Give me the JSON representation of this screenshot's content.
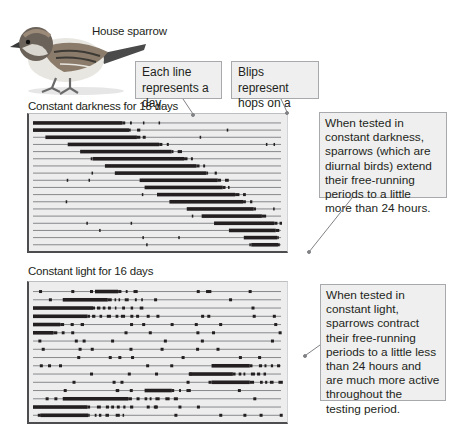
{
  "figure": {
    "species_label": "House sparrow",
    "callouts": {
      "each_line": "Each line represents a day.",
      "each_line_lines": [
        "Each line",
        "represents a day."
      ],
      "blips": "Blips represent hops on a perch.",
      "blips_lines": [
        "Blips represent",
        "hops on a perch."
      ],
      "darkness_note": "When tested in constant darkness, sparrows (which are diurnal birds) extend their free-running periods to a little more than 24 hours.",
      "light_note": "When tested in constant light, sparrows contract their free-running periods to a little less than 24 hours and are much more active throughout the testing period."
    },
    "panels": [
      {
        "title": "Constant darkness for 18 days",
        "condition": "constant darkness",
        "days": 18,
        "trend": "activity onset drifts later each day (period > 24 h)"
      },
      {
        "title": "Constant light for 16 days",
        "condition": "constant light",
        "days": 16,
        "trend": "activity onset drifts earlier each day (period < 24 h)"
      }
    ],
    "colors": {
      "panel_bg": "#ededee",
      "callout_bg": "#efefef",
      "callout_border": "#a7a9ac",
      "trace": "#231f20",
      "leader_line": "#808285"
    }
  },
  "chart_data": [
    {
      "type": "actogram",
      "title": "Constant darkness for 18 days",
      "rows": 18,
      "xlabel": "Time of day (each line = 24 h)",
      "ylabel": "Day",
      "activity_onset_fraction": [
        0.0,
        0.0,
        0.05,
        0.14,
        0.19,
        0.24,
        0.29,
        0.33,
        0.43,
        0.45,
        0.5,
        0.55,
        0.62,
        0.68,
        0.73,
        0.79,
        0.85,
        0.88
      ],
      "activity_offset_fraction": [
        0.4,
        0.43,
        0.46,
        0.55,
        0.6,
        0.65,
        0.7,
        0.74,
        0.78,
        0.8,
        0.85,
        0.88,
        0.92,
        0.95,
        1.0,
        1.0,
        1.0,
        1.0
      ]
    },
    {
      "type": "actogram",
      "title": "Constant light for 16 days",
      "rows": 16,
      "xlabel": "Time of day (each line = 24 h)",
      "ylabel": "Day",
      "main_block_start_fraction": [
        0.25,
        0.12,
        0.0,
        0.0,
        0.0,
        0.0,
        0.0,
        0.0,
        0.0,
        0.72,
        0.63,
        0.72,
        0.45,
        0.12,
        0.0,
        0.03
      ],
      "main_block_end_fraction": [
        0.42,
        0.45,
        0.44,
        0.4,
        0.2,
        0.15,
        0.0,
        0.0,
        0.0,
        1.0,
        0.95,
        1.0,
        0.65,
        0.6,
        0.4,
        0.38
      ]
    }
  ]
}
